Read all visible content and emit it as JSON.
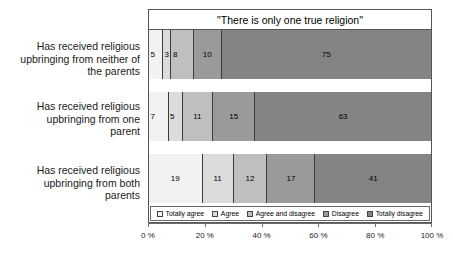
{
  "chart_data": {
    "type": "bar",
    "subtype": "stacked-horizontal-100pct",
    "title": "\"There is only one true religion\"",
    "xlabel": "",
    "ylabel": "",
    "xlim": [
      0,
      100
    ],
    "grid": false,
    "legend_position": "inside-bottom",
    "axis_ticks": [
      "0 %",
      "20 %",
      "40 %",
      "60 %",
      "80 %",
      "100 %"
    ],
    "axis_tick_values": [
      0,
      20,
      40,
      60,
      80,
      100
    ],
    "categories": [
      "Has received religious upbringing from neither of the parents",
      "Has received religious upbringing from one parent",
      "Has received religious upbringing from both parents"
    ],
    "series": [
      {
        "name": "Totally agree",
        "color": "#f2f2f2",
        "values": [
          5,
          7,
          19
        ]
      },
      {
        "name": "Agree",
        "color": "#dcdcdc",
        "values": [
          3,
          5,
          11
        ]
      },
      {
        "name": "Agree and disagree",
        "color": "#bfbfbf",
        "values": [
          8,
          11,
          12
        ]
      },
      {
        "name": "Disagree",
        "color": "#9a9a9a",
        "values": [
          10,
          15,
          17
        ]
      },
      {
        "name": "Totally disagree",
        "color": "#848484",
        "values": [
          75,
          63,
          41
        ]
      }
    ]
  },
  "legend": {
    "items": [
      {
        "label": "Totally agree"
      },
      {
        "label": "Agree"
      },
      {
        "label": "Agree and disagree"
      },
      {
        "label": "Disagree"
      },
      {
        "label": "Totally disagree"
      }
    ]
  },
  "category_labels": [
    {
      "lines": [
        "Has received religious",
        "upbringing from neither of",
        "the parents"
      ]
    },
    {
      "lines": [
        "Has received religious",
        "upbringing from one",
        "parent"
      ]
    },
    {
      "lines": [
        "Has received religious",
        "upbringing from both",
        "parents"
      ]
    }
  ]
}
